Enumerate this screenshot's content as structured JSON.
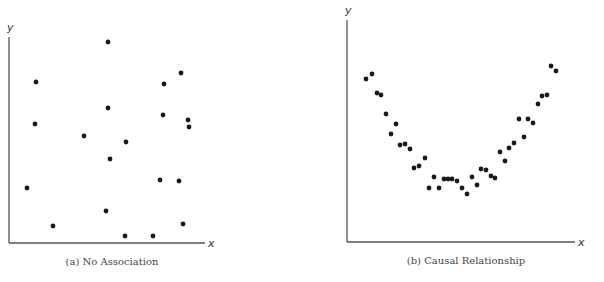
{
  "chart_data": [
    {
      "type": "scatter",
      "title": "",
      "caption": "(a) No Association",
      "xlabel": "x",
      "ylabel": "y",
      "grid": false,
      "legend": null,
      "pixel_frame": {
        "origin_x": 9,
        "origin_y": 243,
        "x_end": 205,
        "y_top": 37
      },
      "points_px": [
        [
          108,
          42
        ],
        [
          36,
          82
        ],
        [
          35,
          124
        ],
        [
          108,
          108
        ],
        [
          84,
          136
        ],
        [
          126,
          142
        ],
        [
          110,
          159
        ],
        [
          27,
          188
        ],
        [
          53,
          226
        ],
        [
          106,
          211
        ],
        [
          125,
          236
        ],
        [
          153,
          236
        ],
        [
          164,
          84
        ],
        [
          163,
          115
        ],
        [
          181,
          73
        ],
        [
          188,
          120
        ],
        [
          189,
          127
        ],
        [
          160,
          180
        ],
        [
          179,
          181
        ],
        [
          183,
          224
        ]
      ]
    },
    {
      "type": "scatter",
      "title": "",
      "caption": "(b) Causal Relationship",
      "xlabel": "x",
      "ylabel": "y",
      "grid": false,
      "legend": null,
      "pixel_frame": {
        "origin_x": 347,
        "origin_y": 242,
        "x_end": 575,
        "y_top": 20
      },
      "points_px": [
        [
          366,
          79
        ],
        [
          372,
          74
        ],
        [
          377,
          93
        ],
        [
          381,
          95
        ],
        [
          386,
          114
        ],
        [
          391,
          134
        ],
        [
          396,
          124
        ],
        [
          400,
          145
        ],
        [
          405,
          144
        ],
        [
          410,
          149
        ],
        [
          414,
          168
        ],
        [
          419,
          166
        ],
        [
          425,
          158
        ],
        [
          429,
          188
        ],
        [
          434,
          177
        ],
        [
          439,
          188
        ],
        [
          444,
          179
        ],
        [
          448,
          179
        ],
        [
          452,
          179
        ],
        [
          457,
          181
        ],
        [
          462,
          188
        ],
        [
          467,
          194
        ],
        [
          472,
          177
        ],
        [
          477,
          185
        ],
        [
          481,
          169
        ],
        [
          486,
          170
        ],
        [
          491,
          176
        ],
        [
          495,
          178
        ],
        [
          500,
          152
        ],
        [
          505,
          161
        ],
        [
          509,
          148
        ],
        [
          514,
          143
        ],
        [
          519,
          119
        ],
        [
          524,
          137
        ],
        [
          528,
          119
        ],
        [
          533,
          123
        ],
        [
          538,
          104
        ],
        [
          542,
          96
        ],
        [
          547,
          95
        ],
        [
          551,
          66
        ],
        [
          556,
          71
        ]
      ]
    }
  ],
  "charts": {
    "a": {
      "caption": "(a) No Association",
      "xlabel": "x",
      "ylabel": "y"
    },
    "b": {
      "caption": "(b) Causal Relationship",
      "xlabel": "x",
      "ylabel": "y"
    }
  }
}
